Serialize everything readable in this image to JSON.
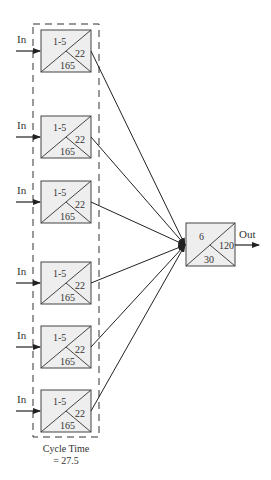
{
  "diagram": {
    "input_label": "In",
    "output_label": "Out",
    "cycle_time": {
      "line1": "Cycle Time",
      "line2": "= 27.5"
    },
    "stations": [
      {
        "top": "1-5",
        "right": "22",
        "bottom": "165",
        "y": 30
      },
      {
        "top": "1-5",
        "right": "22",
        "bottom": "165",
        "y": 116
      },
      {
        "top": "1-5",
        "right": "22",
        "bottom": "165",
        "y": 181
      },
      {
        "top": "1-5",
        "right": "22",
        "bottom": "165",
        "y": 262
      },
      {
        "top": "1-5",
        "right": "22",
        "bottom": "165",
        "y": 326
      },
      {
        "top": "1-5",
        "right": "22",
        "bottom": "165",
        "y": 390
      }
    ],
    "final_station": {
      "top": "6",
      "right": "120",
      "bottom": "30"
    },
    "colors": {
      "box_fill": "#eeeeee",
      "stroke": "#444444"
    }
  }
}
